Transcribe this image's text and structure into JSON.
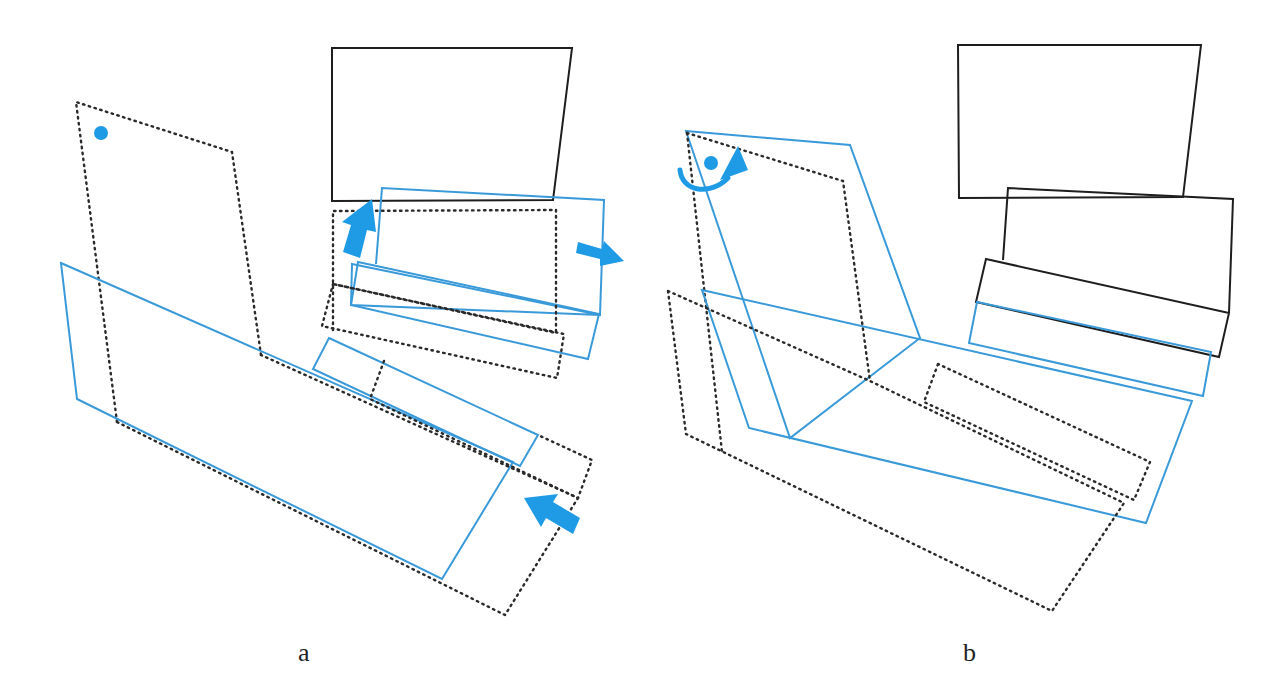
{
  "figure": {
    "panels": [
      {
        "id": "a",
        "label": "a",
        "shapes": {
          "dotted_rotated_sheet": "dotted outline of tilted upper-left sheet",
          "blue_large_sheet": "blue outline large tilted sheet",
          "black_top_box": "black solid box at top",
          "blue_mid_box": "blue tilted box under top box",
          "dotted_mid_box": "dotted box outline",
          "blue_thin_strip": "blue thin strip",
          "dotted_bottom_box": "dotted outline large lower box"
        },
        "annotations": [
          {
            "type": "dot",
            "color": "#1f9be6"
          },
          {
            "type": "arrow",
            "direction": "up",
            "color": "#1f9be6"
          },
          {
            "type": "arrow",
            "direction": "right",
            "color": "#1f9be6"
          },
          {
            "type": "arrow",
            "direction": "up-left",
            "color": "#1f9be6"
          }
        ]
      },
      {
        "id": "b",
        "label": "b",
        "shapes": {
          "blue_rotated_sheet": "blue tilted tall sheet",
          "dotted_sheet": "dotted tall sheet",
          "black_top_box": "black solid box top",
          "black_second_box": "black solid second box",
          "black_strip": "black tilted strip",
          "blue_strip": "blue strip below black strip",
          "blue_large_sheet": "blue large lower sheet",
          "dotted_lower_box": "dotted lower box",
          "dotted_inner_strip": "dotted inner strip"
        },
        "annotations": [
          {
            "type": "dot",
            "color": "#1f9be6"
          },
          {
            "type": "curved-arrow",
            "direction": "clockwise",
            "color": "#1f9be6"
          }
        ]
      }
    ],
    "colors": {
      "blue": "#1f9be6",
      "blue_line": "#3a9ad9",
      "black": "#1e1e1e",
      "background": "#ffffff"
    }
  }
}
